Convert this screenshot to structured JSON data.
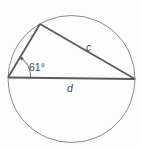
{
  "diagram": {
    "type": "geometry",
    "labels": {
      "angle": "61°",
      "side_c": "c",
      "side_d": "d"
    },
    "colors": {
      "circle": "#8a8a8a",
      "triangle": "#5a5a5a",
      "text": "#444444",
      "background": "#fdfdfd"
    }
  }
}
